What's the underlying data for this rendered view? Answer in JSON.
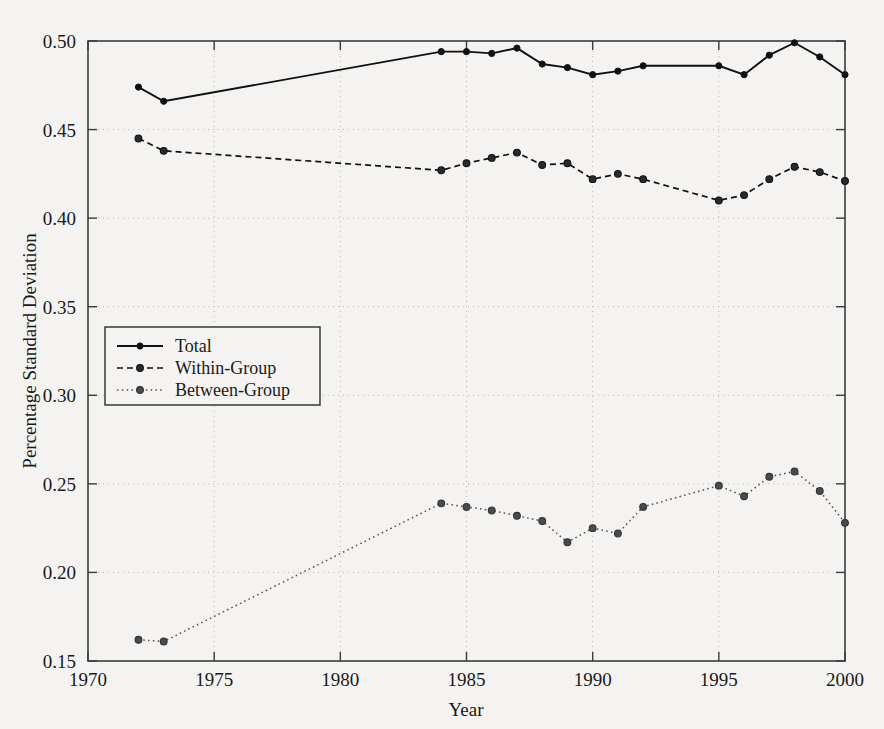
{
  "chart_data": {
    "type": "line",
    "title": "",
    "xlabel": "Year",
    "ylabel": "Percentage Standard Deviation",
    "xlim": [
      1970,
      2000
    ],
    "ylim": [
      0.15,
      0.5
    ],
    "xticks": [
      1970,
      1975,
      1980,
      1985,
      1990,
      1995,
      2000
    ],
    "xtick_labels": [
      "1970",
      "1975",
      "1980",
      "1985",
      "1990",
      "1995",
      "2000"
    ],
    "yticks": [
      0.15,
      0.2,
      0.25,
      0.3,
      0.35,
      0.4,
      0.45,
      0.5
    ],
    "ytick_labels": [
      "0.15",
      "0.20",
      "0.25",
      "0.30",
      "0.35",
      "0.40",
      "0.45",
      "0.50"
    ],
    "grid": true,
    "legend_position": "center-left",
    "x": [
      1972,
      1973,
      1984,
      1985,
      1986,
      1987,
      1988,
      1989,
      1990,
      1991,
      1992,
      1995,
      1996,
      1997,
      1998,
      1999,
      2000
    ],
    "series": [
      {
        "name": "Total",
        "style": "solid",
        "marker": "filled-circle",
        "values": [
          0.474,
          0.466,
          0.494,
          0.494,
          0.493,
          0.496,
          0.487,
          0.485,
          0.481,
          0.483,
          0.486,
          0.486,
          0.481,
          0.492,
          0.499,
          0.491,
          0.481
        ]
      },
      {
        "name": "Within-Group",
        "style": "dashed",
        "marker": "open-circle",
        "values": [
          0.445,
          0.438,
          0.427,
          0.431,
          0.434,
          0.437,
          0.43,
          0.431,
          0.422,
          0.425,
          0.422,
          0.41,
          0.413,
          0.422,
          0.429,
          0.426,
          0.421
        ]
      },
      {
        "name": "Between-Group",
        "style": "dotted",
        "marker": "open-circle",
        "values": [
          0.162,
          0.161,
          0.239,
          0.237,
          0.235,
          0.232,
          0.229,
          0.217,
          0.225,
          0.222,
          0.237,
          0.249,
          0.243,
          0.254,
          0.257,
          0.246,
          0.228
        ]
      }
    ],
    "legend_entries": [
      "Total",
      "Within-Group",
      "Between-Group"
    ],
    "colors": {
      "total": "#111111",
      "within": "#2a2a2a",
      "between": "#4a4a4a",
      "grid": "#b9b6b2",
      "frame": "#3b3b3b",
      "background": "#f4f3f1"
    }
  }
}
